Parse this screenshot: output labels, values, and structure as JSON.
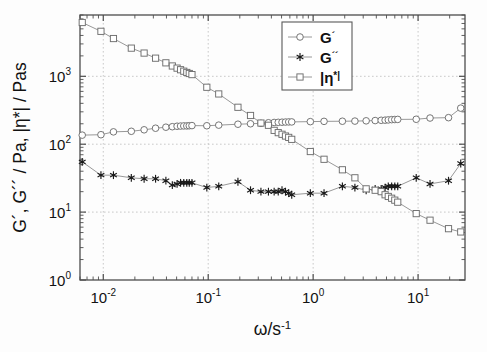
{
  "chart_data": {
    "type": "line",
    "title": "",
    "xlabel": "ω/s⁻¹",
    "ylabel": "G´, G´´ / Pa, |η*| / Pas",
    "xscale": "log",
    "yscale": "log",
    "xlim": [
      0.006,
      28
    ],
    "ylim": [
      1,
      8000
    ],
    "grid": true,
    "legend_position": "top-right",
    "xticks": [
      {
        "value": 0.01,
        "label": "10",
        "exponent": "-2"
      },
      {
        "value": 0.1,
        "label": "10",
        "exponent": "-1"
      },
      {
        "value": 1,
        "label": "10",
        "exponent": "0"
      },
      {
        "value": 10,
        "label": "10",
        "exponent": "1"
      }
    ],
    "yticks": [
      {
        "value": 1,
        "label": "10",
        "exponent": "0"
      },
      {
        "value": 10,
        "label": "10",
        "exponent": "1"
      },
      {
        "value": 100,
        "label": "10",
        "exponent": "2"
      },
      {
        "value": 1000,
        "label": "10",
        "exponent": "3"
      }
    ],
    "series": [
      {
        "name": "G´",
        "legend_label": "G´",
        "marker": "circle",
        "color": "#6e6e6e",
        "points": [
          [
            0.0063,
            136
          ],
          [
            0.0095,
            138
          ],
          [
            0.0125,
            152
          ],
          [
            0.0185,
            155
          ],
          [
            0.0245,
            163
          ],
          [
            0.0315,
            172
          ],
          [
            0.0395,
            178
          ],
          [
            0.0455,
            181
          ],
          [
            0.0505,
            184
          ],
          [
            0.0545,
            185
          ],
          [
            0.0585,
            186
          ],
          [
            0.0625,
            186
          ],
          [
            0.066,
            187
          ],
          [
            0.07,
            188
          ],
          [
            0.097,
            187
          ],
          [
            0.126,
            191
          ],
          [
            0.192,
            197
          ],
          [
            0.253,
            200
          ],
          [
            0.318,
            203
          ],
          [
            0.375,
            207
          ],
          [
            0.425,
            209
          ],
          [
            0.465,
            210
          ],
          [
            0.505,
            211
          ],
          [
            0.545,
            212
          ],
          [
            0.585,
            213
          ],
          [
            0.625,
            213
          ],
          [
            0.94,
            215
          ],
          [
            1.27,
            217
          ],
          [
            1.9,
            218
          ],
          [
            2.5,
            219
          ],
          [
            3.2,
            221
          ],
          [
            3.9,
            223
          ],
          [
            4.45,
            225
          ],
          [
            4.85,
            226
          ],
          [
            5.2,
            228
          ],
          [
            5.6,
            230
          ],
          [
            6.0,
            231
          ],
          [
            6.4,
            232
          ],
          [
            9.6,
            233
          ],
          [
            13.0,
            243
          ],
          [
            19.5,
            246
          ],
          [
            25.5,
            340
          ]
        ]
      },
      {
        "name": "G´´",
        "legend_label": "G´´",
        "marker": "star",
        "color": "#1a1a1a",
        "points": [
          [
            0.0063,
            55
          ],
          [
            0.0095,
            35
          ],
          [
            0.0125,
            35
          ],
          [
            0.0185,
            32
          ],
          [
            0.0245,
            31
          ],
          [
            0.0315,
            31
          ],
          [
            0.0395,
            29
          ],
          [
            0.0455,
            25
          ],
          [
            0.0505,
            26
          ],
          [
            0.0545,
            27
          ],
          [
            0.0585,
            27
          ],
          [
            0.0625,
            27
          ],
          [
            0.066,
            27
          ],
          [
            0.07,
            27
          ],
          [
            0.097,
            23
          ],
          [
            0.126,
            24
          ],
          [
            0.192,
            28
          ],
          [
            0.253,
            21
          ],
          [
            0.318,
            20
          ],
          [
            0.375,
            20
          ],
          [
            0.425,
            20
          ],
          [
            0.465,
            20
          ],
          [
            0.505,
            21
          ],
          [
            0.545,
            20
          ],
          [
            0.585,
            19
          ],
          [
            0.625,
            18
          ],
          [
            0.94,
            19
          ],
          [
            1.27,
            19
          ],
          [
            1.9,
            24
          ],
          [
            2.5,
            23
          ],
          [
            3.2,
            21
          ],
          [
            3.9,
            22
          ],
          [
            4.45,
            22
          ],
          [
            4.85,
            23
          ],
          [
            5.2,
            24
          ],
          [
            5.6,
            24
          ],
          [
            6.0,
            24
          ],
          [
            6.4,
            24
          ],
          [
            9.6,
            32
          ],
          [
            13.0,
            26
          ],
          [
            19.5,
            29
          ],
          [
            25.5,
            52
          ]
        ]
      },
      {
        "name": "|η*|",
        "legend_label": "|η*|",
        "marker": "square",
        "color": "#6e6e6e",
        "points": [
          [
            0.0063,
            6200
          ],
          [
            0.0095,
            4600
          ],
          [
            0.0125,
            3600
          ],
          [
            0.0185,
            2600
          ],
          [
            0.0245,
            2200
          ],
          [
            0.0315,
            1850
          ],
          [
            0.0395,
            1580
          ],
          [
            0.0455,
            1420
          ],
          [
            0.0505,
            1320
          ],
          [
            0.0545,
            1250
          ],
          [
            0.0585,
            1190
          ],
          [
            0.0625,
            1140
          ],
          [
            0.066,
            1100
          ],
          [
            0.07,
            1060
          ],
          [
            0.097,
            690
          ],
          [
            0.126,
            550
          ],
          [
            0.192,
            350
          ],
          [
            0.253,
            265
          ],
          [
            0.318,
            205
          ],
          [
            0.375,
            190
          ],
          [
            0.425,
            160
          ],
          [
            0.465,
            148
          ],
          [
            0.505,
            140
          ],
          [
            0.545,
            132
          ],
          [
            0.585,
            126
          ],
          [
            0.625,
            118
          ],
          [
            0.94,
            78
          ],
          [
            1.27,
            60
          ],
          [
            1.9,
            42
          ],
          [
            2.5,
            32
          ],
          [
            3.2,
            22
          ],
          [
            3.9,
            21
          ],
          [
            4.45,
            20
          ],
          [
            4.85,
            18
          ],
          [
            5.2,
            17
          ],
          [
            5.6,
            16
          ],
          [
            6.0,
            15
          ],
          [
            6.4,
            14
          ],
          [
            9.6,
            9.5
          ],
          [
            13.0,
            7.6
          ],
          [
            19.5,
            5.7
          ],
          [
            25.5,
            5.1
          ]
        ]
      }
    ]
  },
  "legend": {
    "entries": [
      {
        "label": "G",
        "prime": "´",
        "marker": "circle"
      },
      {
        "label": "G",
        "prime": "´´",
        "marker": "star"
      },
      {
        "label": "|η",
        "prime": "*|",
        "marker": "square"
      }
    ]
  },
  "axes": {
    "x_title_main": "ω/s",
    "x_title_sup": "-1",
    "y_title": "G´, G´´ / Pa, |η*| / Pas"
  },
  "colors": {
    "axis": "#4d4d4d",
    "grid": "#bdbdbd",
    "series_gray": "#6e6e6e",
    "series_black": "#1a1a1a",
    "background": "#fdfdfd"
  }
}
